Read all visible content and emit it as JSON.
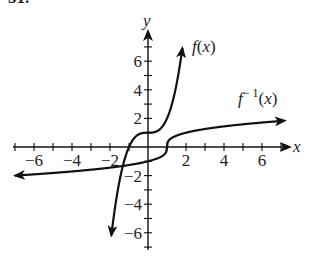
{
  "problem": {
    "label": "31."
  },
  "chart_data": {
    "type": "line",
    "title": "",
    "xlabel": "x",
    "ylabel": "y",
    "xlim": [
      -7,
      7.3
    ],
    "ylim": [
      -7,
      7.5
    ],
    "grid": false,
    "x_ticks": [
      -6,
      -4,
      -2,
      2,
      4,
      6
    ],
    "y_ticks": [
      -6,
      -4,
      -2,
      2,
      4,
      6
    ],
    "x_tick_labels": [
      "−6",
      "−4",
      "−2",
      "2",
      "4",
      "6"
    ],
    "y_tick_labels": [
      "6",
      "4",
      "2",
      "−2",
      "−4",
      "−6"
    ],
    "series": [
      {
        "name": "f(x)",
        "label": "f(x)",
        "formula": "x^3 + 1",
        "x": [
          -1.95,
          -1.5,
          -1.2,
          -1.0,
          -0.8,
          -0.5,
          -0.2,
          0,
          0.2,
          0.5,
          0.8,
          1.0,
          1.2,
          1.5,
          1.8
        ],
        "y": [
          -6.4,
          -2.4,
          -0.73,
          0,
          0.49,
          0.88,
          0.99,
          1,
          1.01,
          1.13,
          1.51,
          2,
          2.73,
          4.38,
          6.8
        ]
      },
      {
        "name": "f^-1(x)",
        "label": "f⁻¹(x)",
        "formula": "cbrt(x - 1)",
        "x": [
          -7,
          -5,
          -3,
          -1,
          0,
          0.5,
          0.8,
          1,
          1.2,
          1.5,
          2,
          3,
          5,
          7
        ],
        "y": [
          -2.0,
          -1.82,
          -1.59,
          -1.26,
          -1,
          -0.79,
          -0.58,
          0,
          0.58,
          0.79,
          1,
          1.26,
          1.59,
          1.82
        ]
      }
    ]
  }
}
